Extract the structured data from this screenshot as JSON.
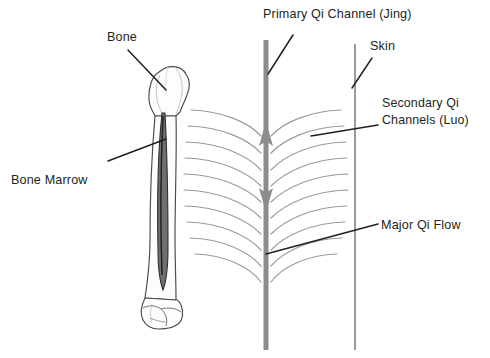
{
  "figure": {
    "background_color": "#ffffff",
    "width": 490,
    "height": 358
  },
  "labels": {
    "bone": "Bone",
    "bone_marrow": "Bone Marrow",
    "primary_qi_channel": "Primary Qi Channel (Jing)",
    "skin": "Skin",
    "secondary_qi_channels_line1": "Secondary Qi",
    "secondary_qi_channels_line2": "Channels (Luo)",
    "major_qi_flow": "Major Qi Flow"
  },
  "colors": {
    "text": "#231f20",
    "leader_line": "#231f20",
    "bone_outline": "#4a4a4a",
    "bone_fill": "#fefefe",
    "marrow_fill": "#6f6f6f",
    "primary_channel": "#8c8c8c",
    "secondary_channel": "#9a9a9a",
    "skin_line": "#9a9a9a"
  },
  "elements": {
    "primary_channel": {
      "name": "Primary Qi Channel (Jing)",
      "orientation": "vertical",
      "x": 266,
      "y_top": 40,
      "y_bottom": 350,
      "stroke_width": 5,
      "arrows": [
        {
          "direction": "up",
          "y": 132
        },
        {
          "direction": "down",
          "y": 196
        }
      ]
    },
    "skin_line": {
      "name": "Skin",
      "orientation": "vertical",
      "x": 355,
      "y_top": 44,
      "y_bottom": 350,
      "stroke_width": 2
    },
    "secondary_channels": {
      "name": "Secondary Qi Channels (Luo)",
      "count_left": 10,
      "count_right": 10,
      "description": "Curved arcs sweeping from outer edges inward toward the primary channel"
    },
    "bone": {
      "name": "Bone",
      "description": "Long bone (femur/humerus) with rounded head at top and condyles at bottom",
      "x_center": 163,
      "y_top": 68,
      "y_bottom": 330
    },
    "bone_marrow": {
      "name": "Bone Marrow",
      "description": "Dark narrow medullary cavity inside the bone shaft",
      "y_top": 113,
      "y_bottom": 290
    }
  },
  "leader_lines": [
    {
      "name": "bone-leader",
      "from": [
        128,
        50
      ],
      "to": [
        166,
        90
      ]
    },
    {
      "name": "bone-marrow-leader",
      "from": [
        108,
        161
      ],
      "to": [
        165,
        139
      ]
    },
    {
      "name": "primary-qi-leader",
      "from": [
        293,
        35
      ],
      "to": [
        268,
        73
      ]
    },
    {
      "name": "skin-leader",
      "from": [
        372,
        58
      ],
      "to": [
        352,
        88
      ]
    },
    {
      "name": "secondary-qi-leader",
      "from": [
        378,
        125
      ],
      "to": [
        311,
        136
      ]
    },
    {
      "name": "major-qi-flow-leader",
      "from": [
        378,
        224
      ],
      "to": [
        266,
        254
      ]
    }
  ]
}
